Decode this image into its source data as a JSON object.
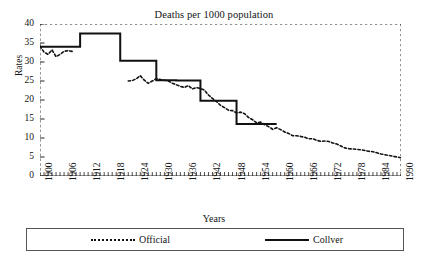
{
  "chart_data": {
    "type": "line",
    "title": "Deaths per 1000 population",
    "xlabel": "Years",
    "ylabel": "Rates",
    "xlim": [
      1900,
      1990
    ],
    "ylim": [
      0,
      40
    ],
    "yticks": [
      0,
      5,
      10,
      15,
      20,
      25,
      30,
      35,
      40
    ],
    "xticks": [
      1900,
      1906,
      1912,
      1918,
      1924,
      1930,
      1936,
      1942,
      1948,
      1954,
      1960,
      1966,
      1972,
      1978,
      1984,
      1990
    ],
    "grid": false,
    "legend_position": "bottom",
    "series": [
      {
        "name": "Official",
        "style": "dotted",
        "color": "#111111",
        "x": [
          1900,
          1901,
          1902,
          1903,
          1904,
          1905,
          1906,
          1907,
          1908,
          1922,
          1923,
          1924,
          1925,
          1926,
          1927,
          1928,
          1929,
          1930,
          1931,
          1932,
          1933,
          1934,
          1935,
          1936,
          1937,
          1938,
          1939,
          1940,
          1941,
          1942,
          1943,
          1944,
          1945,
          1946,
          1947,
          1948,
          1949,
          1950,
          1951,
          1952,
          1953,
          1954,
          1955,
          1956,
          1957,
          1958,
          1959,
          1960,
          1961,
          1962,
          1963,
          1964,
          1965,
          1966,
          1967,
          1968,
          1969,
          1970,
          1971,
          1972,
          1973,
          1974,
          1975,
          1976,
          1977,
          1978,
          1979,
          1980,
          1981,
          1982,
          1983,
          1984,
          1985,
          1986,
          1987,
          1988,
          1989,
          1990
        ],
        "y": [
          34.2,
          32.6,
          32.0,
          33.2,
          31.4,
          32.0,
          32.8,
          33.0,
          32.8,
          25.0,
          25.1,
          25.6,
          26.4,
          25.2,
          24.4,
          25.0,
          25.6,
          25.4,
          25.2,
          25.0,
          24.4,
          24.0,
          23.6,
          23.3,
          23.8,
          22.9,
          23.3,
          23.0,
          22.6,
          21.3,
          20.4,
          19.6,
          18.6,
          18.0,
          17.3,
          17.2,
          16.6,
          16.8,
          16.4,
          15.4,
          14.8,
          14.0,
          14.2,
          13.5,
          13.0,
          12.3,
          12.7,
          12.2,
          11.6,
          11.2,
          10.6,
          10.6,
          10.4,
          10.2,
          9.8,
          9.8,
          9.4,
          9.1,
          9.2,
          9.1,
          8.7,
          8.4,
          7.9,
          7.4,
          7.2,
          7.1,
          7.0,
          6.9,
          6.7,
          6.5,
          6.4,
          6.1,
          5.8,
          5.6,
          5.4,
          5.2,
          5.0,
          4.8
        ]
      },
      {
        "name": "Collver",
        "style": "solid-step",
        "color": "#111111",
        "steps": [
          {
            "x0": 1900,
            "x1": 1910,
            "y": 34.0
          },
          {
            "x0": 1910,
            "x1": 1920,
            "y": 37.5
          },
          {
            "x0": 1920,
            "x1": 1929,
            "y": 30.3
          },
          {
            "x0": 1929,
            "x1": 1934,
            "y": 25.2
          },
          {
            "x0": 1934,
            "x1": 1940,
            "y": 25.1
          },
          {
            "x0": 1940,
            "x1": 1949,
            "y": 19.8
          },
          {
            "x0": 1949,
            "x1": 1959,
            "y": 13.7
          }
        ]
      }
    ]
  },
  "legend": {
    "official_label": "Official",
    "collver_label": "Collver"
  }
}
